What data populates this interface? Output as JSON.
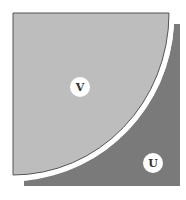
{
  "diagram": {
    "regions": [
      {
        "id": "V",
        "label": "V",
        "shape": "quarter-circle",
        "color": "#bdbdbd"
      },
      {
        "id": "U",
        "label": "U",
        "shape": "square-minus-quarter-circle",
        "color": "#7a7a7a"
      }
    ],
    "gap_color": "#ffffff",
    "outline_color": "#555555"
  }
}
